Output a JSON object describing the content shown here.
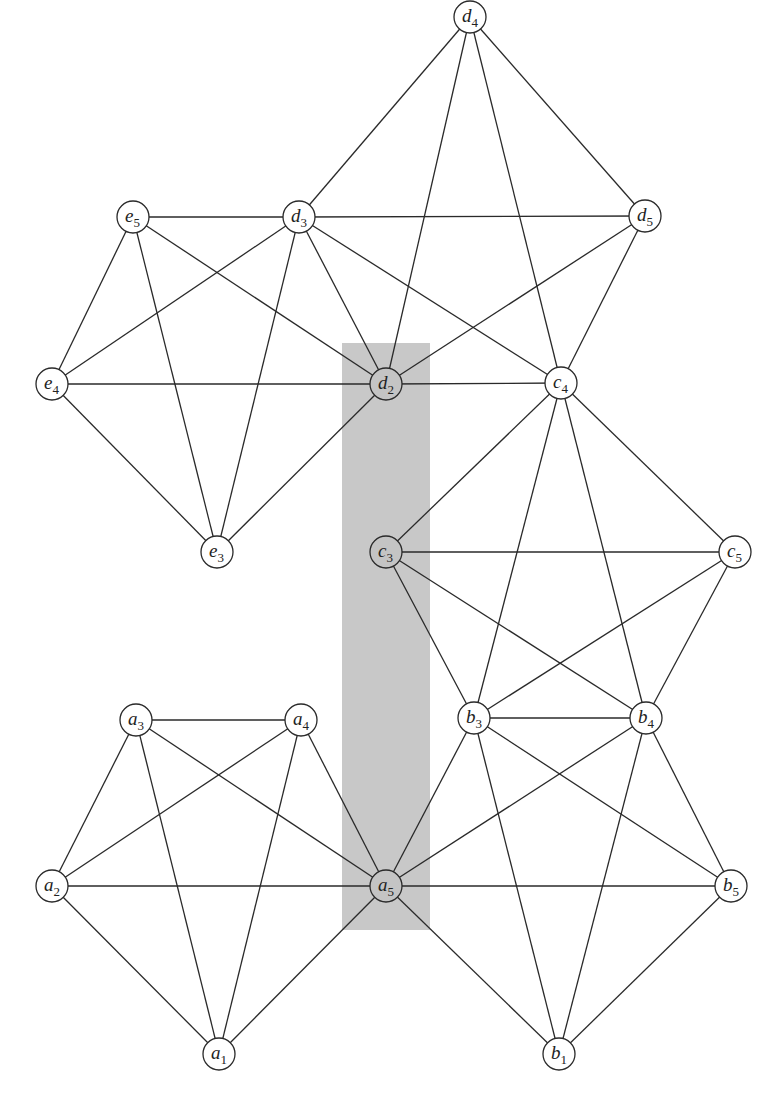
{
  "header": {
    "clipped_text": "Applications of ..."
  },
  "highlight": {
    "x": 342,
    "y": 343,
    "width": 88,
    "height": 587,
    "color": "#c8c8c8"
  },
  "node_radius": 16,
  "nodes": [
    {
      "id": "d4",
      "letter": "d",
      "sub": "4",
      "x": 470,
      "y": 17
    },
    {
      "id": "e5",
      "letter": "e",
      "sub": "5",
      "x": 133,
      "y": 217
    },
    {
      "id": "d3",
      "letter": "d",
      "sub": "3",
      "x": 299,
      "y": 217
    },
    {
      "id": "d5",
      "letter": "d",
      "sub": "5",
      "x": 645,
      "y": 216
    },
    {
      "id": "e4",
      "letter": "e",
      "sub": "4",
      "x": 52,
      "y": 384
    },
    {
      "id": "d2",
      "letter": "d",
      "sub": "2",
      "x": 386,
      "y": 384,
      "shaded": true
    },
    {
      "id": "c4",
      "letter": "c",
      "sub": "4",
      "x": 561,
      "y": 383
    },
    {
      "id": "e3",
      "letter": "e",
      "sub": "3",
      "x": 217,
      "y": 552
    },
    {
      "id": "c3",
      "letter": "c",
      "sub": "3",
      "x": 386,
      "y": 552,
      "shaded": true
    },
    {
      "id": "c5",
      "letter": "c",
      "sub": "5",
      "x": 735,
      "y": 552
    },
    {
      "id": "a3",
      "letter": "a",
      "sub": "3",
      "x": 136,
      "y": 720
    },
    {
      "id": "a4",
      "letter": "a",
      "sub": "4",
      "x": 301,
      "y": 720
    },
    {
      "id": "b3",
      "letter": "b",
      "sub": "3",
      "x": 474,
      "y": 718
    },
    {
      "id": "b4",
      "letter": "b",
      "sub": "4",
      "x": 646,
      "y": 718
    },
    {
      "id": "a2",
      "letter": "a",
      "sub": "2",
      "x": 52,
      "y": 886
    },
    {
      "id": "a5",
      "letter": "a",
      "sub": "5",
      "x": 386,
      "y": 886,
      "shaded": true
    },
    {
      "id": "b5",
      "letter": "b",
      "sub": "5",
      "x": 731,
      "y": 886
    },
    {
      "id": "a1",
      "letter": "a",
      "sub": "1",
      "x": 219,
      "y": 1054
    },
    {
      "id": "b1",
      "letter": "b",
      "sub": "1",
      "x": 559,
      "y": 1054
    }
  ],
  "cliques": [
    [
      "a1",
      "a2",
      "a3",
      "a4",
      "a5"
    ],
    [
      "a5",
      "b1",
      "b3",
      "b4",
      "b5"
    ],
    [
      "b3",
      "b4",
      "c3",
      "c4",
      "c5"
    ],
    [
      "c4",
      "d2",
      "d3",
      "d4",
      "d5"
    ],
    [
      "d2",
      "d3",
      "e3",
      "e4",
      "e5"
    ]
  ]
}
